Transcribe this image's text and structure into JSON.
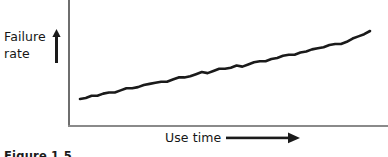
{
  "figure": {
    "caption": "Figure 1.5",
    "background_color": "#ffffff",
    "line_color": "#1a1a1a",
    "axis_color": "#7d7d7d"
  },
  "axes": {
    "y_axis_label_line1": "Failure",
    "y_axis_label_line2": "rate",
    "y_axis_arrow": "arrow-up-icon",
    "x_axis_label": "Use time",
    "x_axis_arrow": "arrow-right-icon"
  },
  "chart_data": {
    "type": "line",
    "title": "",
    "subtitle": "",
    "xlabel": "Use time",
    "ylabel": "Failure rate",
    "xlim": [
      0,
      100
    ],
    "ylim": [
      0,
      100
    ],
    "grid": false,
    "legend": false,
    "legend_position": "none",
    "tick_labels_x": [],
    "tick_labels_y": [],
    "annotations": [],
    "series": [
      {
        "name": "Failure rate",
        "color": "#1a1a1a",
        "x": [
          0,
          2,
          4,
          6,
          8,
          10,
          12,
          14,
          16,
          18,
          20,
          22,
          24,
          26,
          28,
          30,
          32,
          34,
          36,
          38,
          40,
          42,
          44,
          46,
          48,
          50,
          52,
          54,
          56,
          58,
          60,
          62,
          64,
          66,
          68,
          70,
          72,
          74,
          76,
          78,
          80,
          82,
          84,
          86,
          88,
          90,
          92,
          94,
          96,
          98,
          100
        ],
        "y": [
          28,
          29,
          31,
          31,
          33,
          34,
          34,
          36,
          38,
          38,
          39,
          41,
          42,
          43,
          44,
          44,
          46,
          48,
          48,
          49,
          51,
          53,
          52,
          54,
          56,
          56,
          57,
          59,
          58,
          60,
          62,
          63,
          63,
          65,
          66,
          68,
          69,
          69,
          71,
          72,
          74,
          75,
          76,
          78,
          79,
          79,
          81,
          84,
          86,
          88,
          91
        ]
      }
    ]
  }
}
